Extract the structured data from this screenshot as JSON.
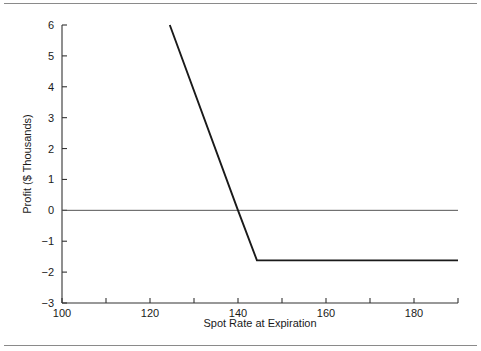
{
  "figure": {
    "name": "profit-diagram",
    "rules": {
      "top": true,
      "bottom": true
    }
  },
  "chart_data": {
    "type": "line",
    "title": "",
    "xlabel": "Spot Rate at Expiration",
    "ylabel": "Profit ($ Thousands)",
    "xlim": [
      100,
      190
    ],
    "ylim": [
      -3,
      6
    ],
    "grid": false,
    "legend": null,
    "xticks": [
      100,
      120,
      140,
      160,
      180
    ],
    "xtick_labels": [
      "100",
      "120",
      "140",
      "160",
      "180"
    ],
    "xminor_ticks": [
      110,
      130,
      150,
      170,
      190
    ],
    "yticks": [
      -3,
      -2,
      -1,
      0,
      1,
      2,
      3,
      4,
      5,
      6
    ],
    "ytick_labels": [
      "−3",
      "−2",
      "−1",
      "0",
      "1",
      "2",
      "3",
      "4",
      "5",
      "6"
    ],
    "zero_line": {
      "y": 0,
      "from_x": 100,
      "to_x": 190,
      "color": "#555555"
    },
    "series": [
      {
        "name": "Profit",
        "color": "#1a1a1a",
        "x": [
          124.5,
          140,
          144.3,
          190
        ],
        "y": [
          6,
          0,
          -1.62,
          -1.62
        ],
        "breakeven_x": 140,
        "kink_x": 144.3,
        "floor_y": -1.62
      }
    ]
  }
}
